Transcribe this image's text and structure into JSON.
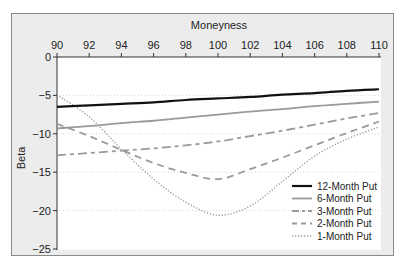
{
  "chart_data": {
    "type": "line",
    "title": "",
    "xlabel": "Moneyness",
    "ylabel": "Beta",
    "x_axis_position": "top",
    "xlim": [
      90,
      110
    ],
    "ylim": [
      -25,
      0
    ],
    "x_ticks": [
      90,
      92,
      94,
      96,
      98,
      100,
      102,
      104,
      106,
      108,
      110
    ],
    "y_ticks": [
      0,
      -5,
      -10,
      -15,
      -20,
      -25
    ],
    "grid": {
      "y": true,
      "x": false,
      "style": "dotted"
    },
    "legend_position": "lower right (inside plot)",
    "x": [
      90,
      92,
      94,
      96,
      98,
      100,
      102,
      104,
      106,
      108,
      110
    ],
    "series": [
      {
        "name": "12-Month Put",
        "style": "solid",
        "color": "#111111",
        "width": 2.2,
        "values": [
          -6.5,
          -6.3,
          -6.1,
          -5.9,
          -5.6,
          -5.4,
          -5.2,
          -4.9,
          -4.7,
          -4.4,
          -4.2
        ]
      },
      {
        "name": "6-Month Put",
        "style": "solid",
        "color": "#9a9a9a",
        "width": 1.8,
        "values": [
          -9.3,
          -9.0,
          -8.6,
          -8.3,
          -7.9,
          -7.5,
          -7.1,
          -6.8,
          -6.4,
          -6.1,
          -5.8
        ]
      },
      {
        "name": "3-Month Put",
        "style": "long-short-dash",
        "color": "#9a9a9a",
        "width": 1.8,
        "values": [
          -12.8,
          -12.5,
          -12.2,
          -11.9,
          -11.5,
          -11.0,
          -10.3,
          -9.6,
          -8.8,
          -8.0,
          -7.3
        ]
      },
      {
        "name": "2-Month Put",
        "style": "dash",
        "color": "#9a9a9a",
        "width": 1.8,
        "values": [
          -8.7,
          -10.3,
          -12.1,
          -13.8,
          -15.1,
          -15.9,
          -14.6,
          -13.1,
          -11.5,
          -9.9,
          -8.4
        ]
      },
      {
        "name": "1-Month Put",
        "style": "dotted",
        "color": "#9a9a9a",
        "width": 1.4,
        "values": [
          -4.9,
          -7.8,
          -12.0,
          -15.9,
          -18.9,
          -20.6,
          -19.4,
          -16.2,
          -12.9,
          -10.7,
          -9.1
        ]
      }
    ]
  },
  "axes": {
    "x_title": "Moneyness",
    "y_title": "Beta",
    "x_tick_labels": [
      "90",
      "92",
      "94",
      "96",
      "98",
      "100",
      "102",
      "104",
      "106",
      "108",
      "110"
    ],
    "y_tick_labels": [
      "0",
      "−5",
      "−10",
      "−15",
      "−20",
      "−25"
    ]
  },
  "legend": {
    "items": [
      {
        "label": "12-Month Put"
      },
      {
        "label": "6-Month Put"
      },
      {
        "label": "3-Month Put"
      },
      {
        "label": "2-Month Put"
      },
      {
        "label": "1-Month Put"
      }
    ]
  }
}
